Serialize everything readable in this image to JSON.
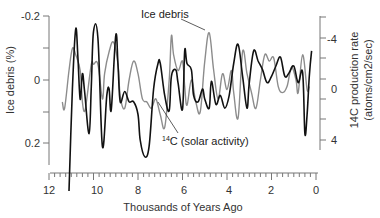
{
  "chart_data": {
    "type": "line",
    "title": "",
    "xlabel": "Thousands of Years Ago",
    "ylabel_left": "Ice debris (%)",
    "ylabel_right_line1": "14C production rate",
    "ylabel_right_line2": "(atoms/cm2/sec)",
    "x_ticks": [
      "12",
      "10",
      "8",
      "6",
      "4",
      "2",
      "0"
    ],
    "left_y_ticks": [
      "-0.2",
      "0",
      "0.2"
    ],
    "right_y_ticks": [
      "-4",
      "0",
      "4"
    ],
    "xlim": [
      12,
      0
    ],
    "left_ylim": [
      -0.2,
      0.2
    ],
    "right_ylim": [
      -4,
      4
    ],
    "left_axis_inverted": true,
    "right_axis_inverted": true,
    "grid": false,
    "legend": "inline annotations",
    "annotations": {
      "ice": "Ice debris",
      "c14_sup": "14",
      "c14_text": "C (solar activity)"
    },
    "series": [
      {
        "name": "Ice debris",
        "axis": "left",
        "color": "#8c8c8c",
        "x": [
          11.4,
          11.3,
          11.1,
          10.95,
          10.8,
          10.6,
          10.5,
          10.4,
          10.3,
          10.1,
          10.0,
          9.8,
          9.6,
          9.5,
          9.3,
          9.1,
          8.9,
          8.8,
          8.6,
          8.4,
          8.2,
          8.0,
          7.8,
          7.6,
          7.4,
          7.2,
          7.0,
          6.8,
          6.6,
          6.5,
          6.4,
          6.2,
          6.0,
          5.9,
          5.8,
          5.6,
          5.4,
          5.2,
          5.0,
          4.8,
          4.6,
          4.4,
          4.2,
          4.0,
          3.8,
          3.7,
          3.5,
          3.3,
          3.1,
          2.9,
          2.7,
          2.5,
          2.3,
          2.1,
          1.9,
          1.7,
          1.5,
          1.3,
          1.1,
          0.9,
          0.8,
          0.6,
          0.4,
          0.3
        ],
        "values": [
          0.07,
          0.09,
          -0.03,
          -0.1,
          -0.08,
          -0.03,
          0.07,
          0.1,
          0.06,
          -0.05,
          -0.05,
          -0.05,
          0.06,
          -0.02,
          -0.09,
          -0.12,
          -0.05,
          0.05,
          0.09,
          0.0,
          -0.06,
          -0.02,
          0.06,
          0.07,
          0.09,
          0.06,
          0.11,
          0.15,
          0.0,
          -0.14,
          -0.08,
          -0.03,
          -0.06,
          0.02,
          0.08,
          0.0,
          0.07,
          0.1,
          -0.06,
          -0.15,
          -0.03,
          0.06,
          -0.02,
          0.03,
          -0.03,
          0.04,
          0.12,
          -0.09,
          -0.02,
          0.04,
          0.09,
          0.0,
          -0.08,
          -0.06,
          -0.07,
          0.02,
          0.04,
          0.02,
          -0.04,
          0.0,
          0.04,
          -0.08,
          0.03,
          0.02
        ]
      },
      {
        "name": "14C (solar activity)",
        "axis": "right",
        "color": "#111111",
        "x": [
          11.1,
          10.95,
          10.8,
          10.7,
          10.6,
          10.5,
          10.4,
          10.2,
          10.1,
          10.0,
          9.8,
          9.6,
          9.4,
          9.3,
          9.2,
          9.0,
          8.9,
          8.8,
          8.6,
          8.4,
          8.2,
          8.0,
          7.9,
          7.7,
          7.5,
          7.3,
          7.1,
          7.0,
          6.8,
          6.6,
          6.5,
          6.3,
          6.2,
          6.0,
          5.9,
          5.8,
          5.6,
          5.5,
          5.3,
          5.1,
          5.0,
          4.8,
          4.7,
          4.5,
          4.3,
          4.1,
          3.9,
          3.7,
          3.5,
          3.3,
          3.1,
          3.0,
          2.8,
          2.6,
          2.4,
          2.2,
          2.0,
          1.8,
          1.6,
          1.4,
          1.2,
          1.0,
          0.8,
          0.6,
          0.5,
          0.4,
          0.3,
          0.2
        ],
        "values": [
          8.0,
          0.0,
          -4.7,
          -2.5,
          0.8,
          -1.2,
          0.2,
          3.5,
          -0.2,
          -4.5,
          -4.0,
          4.5,
          0.5,
          0.0,
          1.6,
          -4.2,
          -1.9,
          1.0,
          0.2,
          1.0,
          1.0,
          2.0,
          4.0,
          5.3,
          4.5,
          0.0,
          -2.0,
          -2.0,
          0.5,
          1.7,
          -1.0,
          -1.5,
          -0.5,
          1.6,
          -3.0,
          -2.0,
          -1.5,
          0.5,
          1.0,
          0.0,
          0.8,
          1.5,
          -0.6,
          1.2,
          0.5,
          1.5,
          0.5,
          -2.0,
          -3.5,
          -1.0,
          1.5,
          -0.5,
          -3.0,
          -2.2,
          -1.5,
          -0.5,
          -1.0,
          -1.8,
          -2.5,
          -1.0,
          -1.3,
          -1.8,
          -0.5,
          -1.3,
          3.5,
          2.0,
          -1.0,
          -3.0
        ]
      }
    ]
  }
}
